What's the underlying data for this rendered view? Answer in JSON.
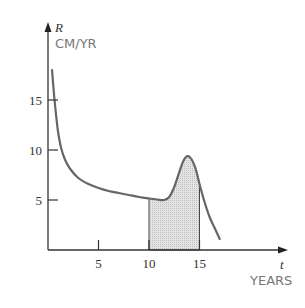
{
  "chart_data": {
    "type": "line",
    "title": "",
    "xlabel": "t",
    "xunit": "YEARS",
    "ylabel": "R",
    "yunit": "CM/YR",
    "xlim": [
      0,
      19.5
    ],
    "ylim": [
      0,
      18.5
    ],
    "xticks": [
      5,
      10,
      15
    ],
    "xtick_labels": [
      "5",
      "10",
      "15"
    ],
    "yticks": [
      5,
      10,
      15
    ],
    "ytick_labels": [
      "5",
      "10",
      "15"
    ],
    "grid": false,
    "legend": null,
    "series": [
      {
        "name": "R(t)",
        "x": [
          0.4,
          0.6,
          0.8,
          1.0,
          1.3,
          1.7,
          2.2,
          3.0,
          4.0,
          5.0,
          6.0,
          7.0,
          8.0,
          9.0,
          10.0,
          10.8,
          11.5,
          12.0,
          12.5,
          13.0,
          13.4,
          13.8,
          14.2,
          14.6,
          15.0,
          15.5,
          16.0,
          16.5,
          17.0
        ],
        "y": [
          18.0,
          15.5,
          13.5,
          11.8,
          10.2,
          9.0,
          8.1,
          7.2,
          6.6,
          6.2,
          5.9,
          5.7,
          5.5,
          5.3,
          5.15,
          5.05,
          5.0,
          5.3,
          6.3,
          7.8,
          8.9,
          9.4,
          9.1,
          8.2,
          6.6,
          4.8,
          3.3,
          2.2,
          1.1
        ],
        "color": "#666666"
      }
    ],
    "shaded_region": {
      "x_from": 10,
      "x_to": 15,
      "description": "area under R(t) from t=10 to t=15",
      "fill": "#d9d9d9"
    }
  }
}
